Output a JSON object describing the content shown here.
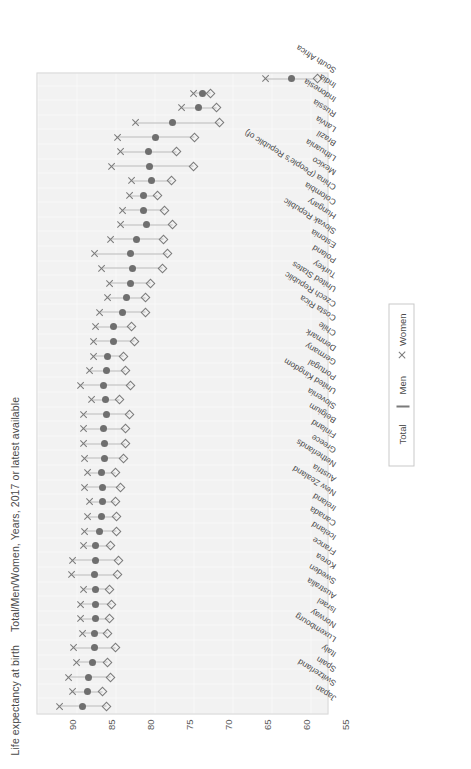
{
  "chart_data": {
    "type": "scatter",
    "title": "Life expectancy at birth",
    "subtitle": "Total/Men/Women, Years, 2017 or latest available",
    "xlabel": "",
    "ylabel": "",
    "ylim": [
      52.5,
      90
    ],
    "yticks": [
      90,
      85,
      80,
      75,
      70,
      65,
      60,
      55
    ],
    "grid": true,
    "legend_position": "bottom-center",
    "orientation": "rotated-90-clockwise",
    "legend": [
      {
        "label": "Total",
        "marker": "filled-circle",
        "color": "#6f6f6f"
      },
      {
        "label": "Men",
        "marker": "open-diamond",
        "color": "#7a7a7a"
      },
      {
        "label": "Women",
        "marker": "cross",
        "color": "#7a7a7a"
      }
    ],
    "series": [
      {
        "name": "Total",
        "marker": "filled-circle"
      },
      {
        "name": "Men",
        "marker": "open-diamond"
      },
      {
        "name": "Women",
        "marker": "cross"
      }
    ],
    "categories": [
      "Japan",
      "Switzerland",
      "Spain",
      "Italy",
      "Luxembourg",
      "Norway",
      "Israel",
      "Australia",
      "Sweden",
      "Korea",
      "France",
      "Iceland",
      "Canada",
      "Ireland",
      "New Zealand",
      "Austria",
      "Netherlands",
      "Greece",
      "Finland",
      "Belgium",
      "Slovenia",
      "United Kingdom",
      "Portugal",
      "Germany",
      "Denmark",
      "Chile",
      "Costa Rica",
      "Czech Republic",
      "United States",
      "Turkey",
      "Poland",
      "Estonia",
      "Slovak Republic",
      "Hungary",
      "Colombia",
      "China (People's Republic of)",
      "Mexico",
      "Lithuania",
      "Brazil",
      "Latvia",
      "Russia",
      "Indonesia",
      "India",
      "South Africa"
    ],
    "values": {
      "Total": [
        84.2,
        83.6,
        83.4,
        83.0,
        82.7,
        82.7,
        82.6,
        82.6,
        82.5,
        82.7,
        82.6,
        82.5,
        82.0,
        81.8,
        81.7,
        81.7,
        81.8,
        81.4,
        81.4,
        81.5,
        81.1,
        81.3,
        81.5,
        81.1,
        81.0,
        80.2,
        80.3,
        79.1,
        78.6,
        78.1,
        77.8,
        78.0,
        77.3,
        76.0,
        76.4,
        76.4,
        75.4,
        75.6,
        75.7,
        74.9,
        72.7,
        69.3,
        68.8,
        57.4
      ],
      "Men": [
        81.1,
        81.6,
        80.6,
        81.0,
        80.0,
        81.0,
        80.7,
        80.5,
        80.8,
        79.7,
        79.6,
        80.6,
        79.9,
        79.9,
        80.0,
        79.4,
        80.0,
        78.9,
        78.7,
        78.7,
        78.2,
        79.5,
        78.1,
        78.7,
        79.0,
        77.5,
        77.9,
        76.1,
        76.1,
        75.5,
        73.9,
        73.3,
        73.8,
        72.6,
        73.7,
        74.6,
        72.8,
        70.0,
        72.1,
        69.8,
        66.6,
        67.0,
        67.8,
        54.1
      ],
      "Women": [
        87.3,
        85.6,
        86.1,
        85.0,
        85.4,
        84.3,
        84.6,
        84.6,
        84.1,
        85.7,
        85.6,
        84.1,
        84.0,
        83.6,
        83.4,
        84.0,
        83.6,
        84.0,
        84.2,
        84.2,
        84.1,
        83.1,
        84.6,
        83.4,
        82.9,
        82.9,
        82.6,
        82.1,
        81.1,
        80.8,
        81.8,
        82.7,
        80.7,
        79.4,
        79.2,
        78.3,
        78.0,
        80.5,
        79.4,
        79.8,
        77.5,
        71.6,
        70.0,
        60.8
      ]
    }
  },
  "axis": {
    "tick_labels": [
      "90",
      "85",
      "80",
      "75",
      "70",
      "65",
      "60",
      "55"
    ]
  }
}
